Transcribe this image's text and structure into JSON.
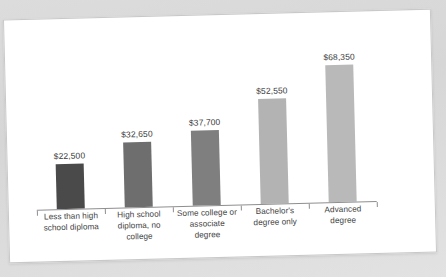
{
  "card": {
    "background_color": "#ffffff",
    "border_color": "#c9c9c9",
    "page_background_color": "#d9d9d9"
  },
  "chart_data": {
    "type": "bar",
    "title": "",
    "subtitle": "",
    "xlabel": "",
    "ylabel": "",
    "grid": false,
    "legend": "none",
    "axis_color": "#8e8e8e",
    "value_label_color": "#3b3b3b",
    "category_label_color": "#3f3f3f",
    "ylim": [
      0,
      75000
    ],
    "categories": [
      "Less than high school diploma",
      "High school diploma, no college",
      "Some college or associate degree",
      "Bachelor's degree only",
      "Advanced degree"
    ],
    "values": [
      22500,
      32650,
      37700,
      52550,
      68350
    ],
    "value_labels": [
      "$22,500",
      "$32,650",
      "$37,700",
      "$52,550",
      "$68,350"
    ],
    "bar_colors": [
      "#4a4a4a",
      "#6e6e6e",
      "#7f7f7f",
      "#b3b3b3",
      "#b9b9b9"
    ],
    "category_label_lines": [
      [
        "Less than high",
        "school diploma"
      ],
      [
        "High school",
        "diploma, no",
        "college"
      ],
      [
        "Some college or",
        "associate",
        "degree"
      ],
      [
        "Bachelor's",
        "degree only"
      ],
      [
        "Advanced",
        "degree"
      ]
    ]
  }
}
